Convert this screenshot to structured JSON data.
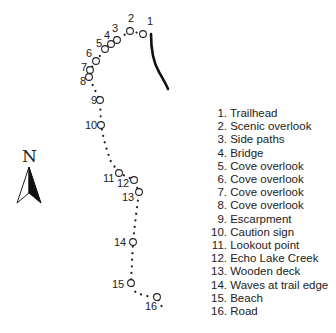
{
  "map": {
    "compass": {
      "label": "N",
      "icon": "north-arrow-icon"
    },
    "trail_color": "#222222",
    "road_color": "#111111",
    "points": [
      {
        "id": "1",
        "cx": 143,
        "cy": 34,
        "lx": 147,
        "ly": 25
      },
      {
        "id": "2",
        "cx": 130,
        "cy": 31,
        "lx": 128,
        "ly": 22
      },
      {
        "id": "3",
        "cx": 117,
        "cy": 40,
        "lx": 112,
        "ly": 32
      },
      {
        "id": "4",
        "cx": 111,
        "cy": 44,
        "lx": 104,
        "ly": 39
      },
      {
        "id": "5",
        "cx": 105,
        "cy": 49,
        "lx": 96,
        "ly": 47
      },
      {
        "id": "6",
        "cx": 96,
        "cy": 61,
        "lx": 86,
        "ly": 57
      },
      {
        "id": "7",
        "cx": 90,
        "cy": 70,
        "lx": 81,
        "ly": 71
      },
      {
        "id": "8",
        "cx": 89,
        "cy": 77,
        "lx": 80,
        "ly": 85
      },
      {
        "id": "9",
        "cx": 100,
        "cy": 100,
        "lx": 91,
        "ly": 104
      },
      {
        "id": "10",
        "cx": 101,
        "cy": 125,
        "lx": 85,
        "ly": 129
      },
      {
        "id": "11",
        "cx": 119,
        "cy": 173,
        "lx": 103,
        "ly": 182
      },
      {
        "id": "12",
        "cx": 134,
        "cy": 180,
        "lx": 117,
        "ly": 187
      },
      {
        "id": "13",
        "cx": 139,
        "cy": 192,
        "lx": 122,
        "ly": 201
      },
      {
        "id": "14",
        "cx": 133,
        "cy": 242,
        "lx": 114,
        "ly": 246
      },
      {
        "id": "15",
        "cx": 131,
        "cy": 283,
        "lx": 112,
        "ly": 288
      },
      {
        "id": "16",
        "cx": 157,
        "cy": 297,
        "lx": 145,
        "ly": 310
      }
    ]
  },
  "legend": {
    "items": [
      {
        "num": "1.",
        "label": "Trailhead"
      },
      {
        "num": "2.",
        "label": "Scenic overlook"
      },
      {
        "num": "3.",
        "label": "Side paths"
      },
      {
        "num": "4.",
        "label": "Bridge"
      },
      {
        "num": "5.",
        "label": "Cove overlook"
      },
      {
        "num": "6.",
        "label": "Cove overlook"
      },
      {
        "num": "7.",
        "label": "Cove overlook"
      },
      {
        "num": "8.",
        "label": "Cove overlook"
      },
      {
        "num": "9.",
        "label": "Escarpment"
      },
      {
        "num": "10.",
        "label": "Caution sign"
      },
      {
        "num": "11.",
        "label": "Lookout point"
      },
      {
        "num": "12.",
        "label": "Echo Lake Creek"
      },
      {
        "num": "13.",
        "label": "Wooden deck"
      },
      {
        "num": "14.",
        "label": "Waves at trail edge"
      },
      {
        "num": "15.",
        "label": "Beach"
      },
      {
        "num": "16.",
        "label": "Road"
      }
    ]
  }
}
